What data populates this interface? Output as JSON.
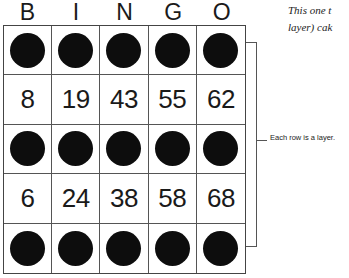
{
  "headers": [
    "B",
    "I",
    "N",
    "G",
    "O"
  ],
  "rows": [
    {
      "type": "chips",
      "cells": [
        "chip",
        "chip",
        "chip",
        "chip",
        "chip"
      ]
    },
    {
      "type": "numbers",
      "cells": [
        "8",
        "19",
        "43",
        "55",
        "62"
      ]
    },
    {
      "type": "chips",
      "cells": [
        "chip",
        "chip",
        "chip",
        "chip",
        "chip"
      ]
    },
    {
      "type": "numbers",
      "cells": [
        "6",
        "24",
        "38",
        "58",
        "68"
      ]
    },
    {
      "type": "chips",
      "cells": [
        "chip",
        "chip",
        "chip",
        "chip",
        "chip"
      ]
    }
  ],
  "annotation": "Each row is a layer.",
  "caption": {
    "line1": "This one t",
    "line2": "layer) cak"
  },
  "colors": {
    "chip": "#0d0d0d",
    "grid_line": "#555555"
  }
}
